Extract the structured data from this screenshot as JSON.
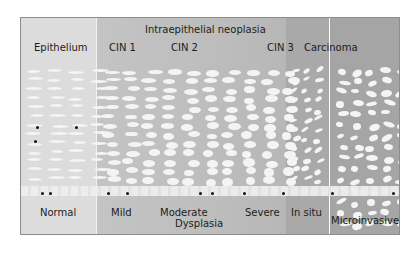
{
  "diagram": {
    "header": "Intraepithelial neoplasia",
    "top_labels": {
      "epithelium": "Epithelium",
      "cin1": "CIN 1",
      "cin2": "CIN 2",
      "cin3": "CIN 3",
      "carcinoma": "Carcinoma"
    },
    "bottom_labels": {
      "normal": "Normal",
      "mild": "Mild",
      "moderate": "Moderate",
      "severe": "Severe",
      "in_situ": "In situ",
      "microinvasive": "Microinvasive",
      "dysplasia": "Dysplasia"
    },
    "colors": {
      "epithelium_bg": "#dcdcdc",
      "dysplasia_bg": "#bdbdbd",
      "in_situ_bg": "#a9a9a9",
      "microinvasive_bg": "#a5a5a5",
      "cell": "#f4f4f4",
      "nucleus_dot": "#111111"
    }
  }
}
